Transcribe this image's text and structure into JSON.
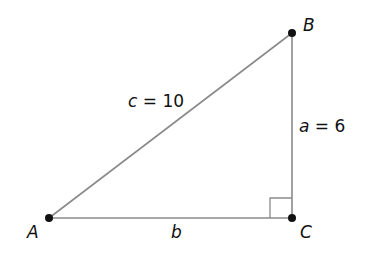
{
  "diagram": {
    "type": "right-triangle",
    "vertices": {
      "A": {
        "label": "A",
        "x": 49,
        "y": 218
      },
      "B": {
        "label": "B",
        "x": 292,
        "y": 33
      },
      "C": {
        "label": "C",
        "x": 292,
        "y": 218
      }
    },
    "sides": {
      "c": {
        "var": "c",
        "eq": " = 10",
        "between": [
          "A",
          "B"
        ]
      },
      "a": {
        "var": "a",
        "eq": " = 6",
        "between": [
          "B",
          "C"
        ]
      },
      "b": {
        "var": "b",
        "between": [
          "A",
          "C"
        ]
      }
    },
    "right_angle_at": "C",
    "colors": {
      "line": "#8a8a8a",
      "point": "#111111",
      "text": "#111111"
    }
  }
}
